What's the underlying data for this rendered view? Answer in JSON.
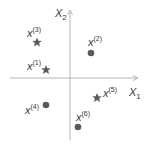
{
  "axes": {
    "x_label": "X",
    "x_sub": "1",
    "y_label": "X",
    "y_sub": "2"
  },
  "colors": {
    "axis": "#b5b5b5",
    "marker": "#5a5a5a",
    "text": "#3a3a3a"
  },
  "points": [
    {
      "label": "x",
      "sup": "(1)",
      "marker": "star"
    },
    {
      "label": "x",
      "sup": "(2)",
      "marker": "circle"
    },
    {
      "label": "x",
      "sup": "(3)",
      "marker": "star"
    },
    {
      "label": "x",
      "sup": "(4)",
      "marker": "circle"
    },
    {
      "label": "x",
      "sup": "(5)",
      "marker": "star"
    },
    {
      "label": "x",
      "sup": "(6)",
      "marker": "circle"
    }
  ]
}
